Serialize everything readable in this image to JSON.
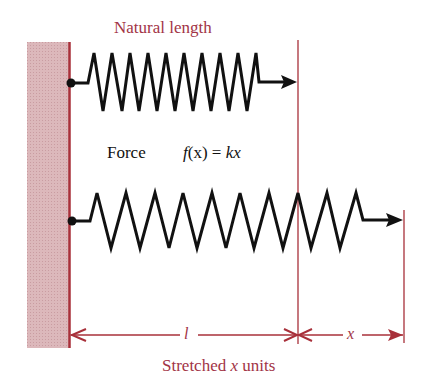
{
  "diagram": {
    "title": "Natural length",
    "force_label": "Force",
    "formula": {
      "func": "f",
      "arg": "(x)",
      "eq": " = ",
      "rhs": "kx"
    },
    "caption": {
      "prefix": "Stretched ",
      "var": "x",
      "suffix": " units"
    },
    "dimension_labels": {
      "natural": "l",
      "stretch": "x"
    },
    "colors": {
      "wall_fill": "#d9b3b6",
      "accent_red": "#a8303a",
      "label_red": "#a23446",
      "spring": "#111111"
    },
    "springs": [
      {
        "name": "natural-spring",
        "coils": 10
      },
      {
        "name": "stretched-spring",
        "coils": 10
      }
    ]
  }
}
